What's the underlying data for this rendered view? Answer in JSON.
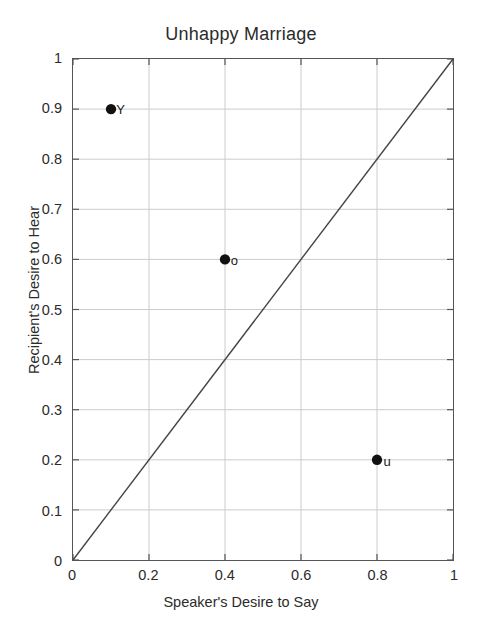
{
  "chart_data": {
    "type": "scatter",
    "title": "Unhappy Marriage",
    "xlabel": "Speaker's Desire to Say",
    "ylabel": "Recipient's Desire to Hear",
    "xlim": [
      0,
      1
    ],
    "ylim": [
      0,
      1
    ],
    "grid": true,
    "legend": "none",
    "xticks": [
      "0",
      "0.2",
      "0.4",
      "0.6",
      "0.8",
      "1"
    ],
    "xtick_values": [
      0,
      0.2,
      0.4,
      0.6,
      0.8,
      1
    ],
    "yticks": [
      "0",
      "0.1",
      "0.2",
      "0.3",
      "0.4",
      "0.5",
      "0.6",
      "0.7",
      "0.8",
      "0.9",
      "1"
    ],
    "ytick_values": [
      0,
      0.1,
      0.2,
      0.3,
      0.4,
      0.5,
      0.6,
      0.7,
      0.8,
      0.9,
      1
    ],
    "points": [
      {
        "label": "Y",
        "x": 0.1,
        "y": 0.9
      },
      {
        "label": "o",
        "x": 0.4,
        "y": 0.6
      },
      {
        "label": "u",
        "x": 0.8,
        "y": 0.2
      }
    ],
    "reference_line": {
      "name": "diagonal y=x",
      "from": [
        0,
        0
      ],
      "to": [
        1,
        1
      ]
    },
    "colors": {
      "marker": "#111111",
      "line": "#444444",
      "grid": "#cccccc",
      "axis": "#555555",
      "background": "#ffffff"
    }
  }
}
